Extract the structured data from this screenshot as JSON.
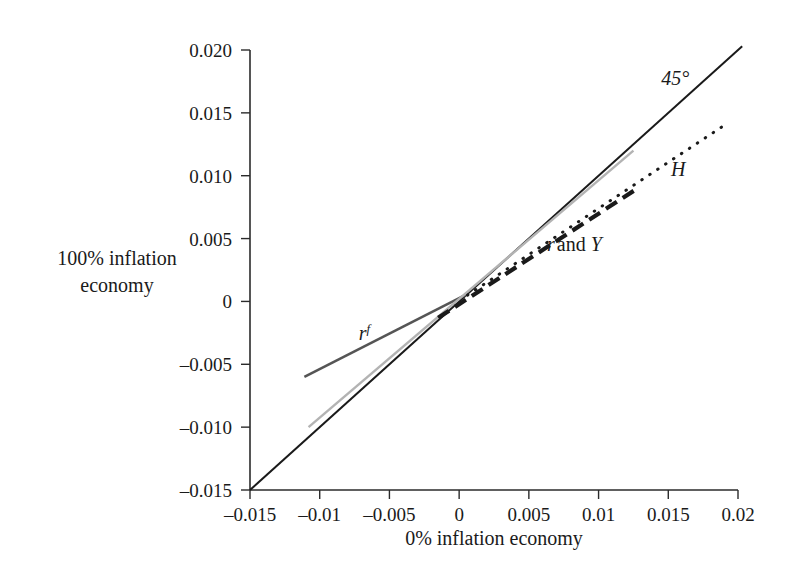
{
  "chart_data": {
    "type": "line",
    "title": "",
    "subtitle": "",
    "xlabel": "0% inflation economy",
    "ylabel_line1": "100% inflation",
    "ylabel_line2": "economy",
    "xlim": [
      -0.015,
      0.02
    ],
    "ylim": [
      -0.015,
      0.02
    ],
    "grid": false,
    "legend_position": "inline-annotations",
    "xticks": [
      -0.015,
      -0.01,
      -0.005,
      0,
      0.005,
      0.01,
      0.015,
      0.02
    ],
    "xticklabels": [
      "-0.015",
      "-0.01",
      "-0.005",
      "0",
      "0.005",
      "0.01",
      "0.015",
      "0.02"
    ],
    "yticks": [
      -0.015,
      -0.01,
      -0.005,
      0,
      0.005,
      0.01,
      0.015,
      0.02
    ],
    "yticklabels": [
      "-0.015",
      "-0.010",
      "-0.005",
      "0",
      "0.005",
      "0.010",
      "0.015",
      "0.020"
    ],
    "series": [
      {
        "name": "45-degree-line",
        "label": "45°",
        "label_x": 0.0145,
        "label_y": 0.0172,
        "style": "solid",
        "color": "#1a1a1a",
        "width": 2.0,
        "x": [
          -0.015,
          0.0203
        ],
        "y": [
          -0.015,
          0.0203
        ]
      },
      {
        "name": "r-superscript-f",
        "label": "r",
        "label_sup": "f",
        "label_x": -0.0072,
        "label_y": -0.0031,
        "style": "solid",
        "color": "#555555",
        "width": 2.6,
        "x": [
          -0.0111,
          0.0006
        ],
        "y": [
          -0.006,
          0.0006
        ]
      },
      {
        "name": "light-gray-line",
        "label": "",
        "style": "solid",
        "color": "#b3b3b3",
        "width": 2.4,
        "x": [
          -0.0108,
          0.0125
        ],
        "y": [
          -0.01,
          0.012
        ]
      },
      {
        "name": "r-and-Y",
        "label_r": "r",
        "label_and": "and",
        "label_Y": "Y",
        "label_x": 0.0063,
        "label_y": 0.004,
        "style": "dashed",
        "color": "#1a1a1a",
        "width": 4.2,
        "x": [
          -0.0015,
          0.0128
        ],
        "y": [
          -0.0013,
          0.009
        ]
      },
      {
        "name": "H",
        "label": "H",
        "label_x": 0.0152,
        "label_y": 0.01,
        "style": "dotted",
        "color": "#1a1a1a",
        "width": 3.0,
        "x": [
          0.0006,
          0.019
        ],
        "y": [
          0.0005,
          0.014
        ]
      }
    ]
  },
  "plot_geometry": {
    "left_px": 250,
    "right_px": 738,
    "top_px": 50,
    "bottom_px": 490
  }
}
